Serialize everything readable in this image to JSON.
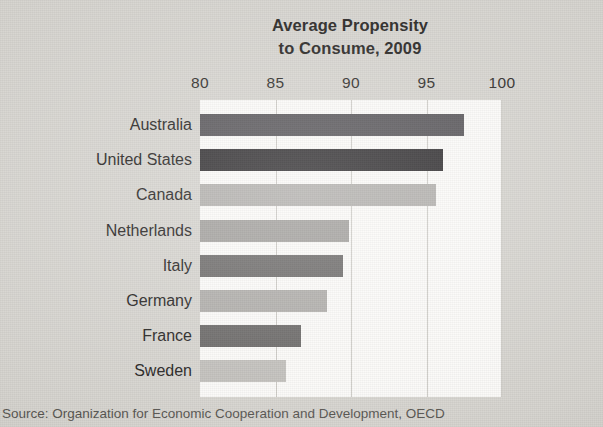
{
  "chart_data": {
    "type": "bar",
    "orientation": "horizontal",
    "title": "Average Propensity to Consume, 2009",
    "title_lines": [
      "Average Propensity",
      "to Consume, 2009"
    ],
    "xlabel": "",
    "ylabel": "",
    "xlim": [
      80,
      100
    ],
    "x_ticks": [
      80,
      85,
      90,
      95,
      100
    ],
    "x_tick_labels": [
      "80",
      "85",
      "90",
      "95",
      "100"
    ],
    "grid": true,
    "grid_axis": "x",
    "legend": "none",
    "categories": [
      "Australia",
      "United States",
      "Canada",
      "Netherlands",
      "Italy",
      "Germany",
      "France",
      "Sweden"
    ],
    "values": [
      97.5,
      96.1,
      95.6,
      89.9,
      89.5,
      88.4,
      86.7,
      85.7
    ],
    "bar_colors": [
      "#58565a",
      "#312f31",
      "#b3b1ae",
      "#a3a19e",
      "#6e6c6b",
      "#b0aeaa",
      "#6a6867",
      "#c2c0bc"
    ],
    "annotations": [],
    "source": "Source: Organization for Economic Cooperation and Development, OECD"
  },
  "colors": {
    "paper_background": "#d6d4cf",
    "plot_background": "#fbfaf8",
    "gridline": "#cdcbc6",
    "text": "#25231f"
  }
}
